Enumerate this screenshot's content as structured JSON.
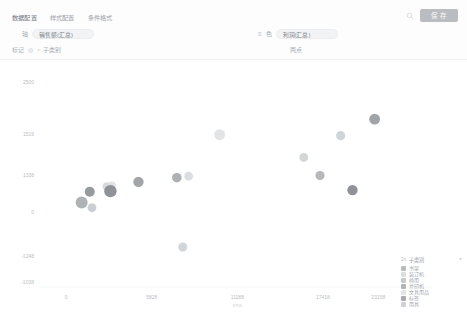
{
  "toolbar": {
    "tabs": [
      {
        "label": "数据配置",
        "active": true
      },
      {
        "label": "样式配置",
        "active": false
      },
      {
        "label": "条件格式",
        "active": false
      }
    ],
    "save_label": "保 存",
    "search_icon": "search-icon",
    "rows": [
      {
        "side": "left",
        "label": "轴",
        "icon": "hash-icon",
        "chip": "销售额(汇总)"
      },
      {
        "side": "right",
        "label": "色",
        "icon_menu": "list-icon",
        "icon_field": "text-icon",
        "chip": "利润(汇总)",
        "ghost": true
      },
      {
        "side": "left",
        "label": "标记",
        "icon1": "shape-icon",
        "icon2": "size-icon",
        "chip": "子类别"
      },
      {
        "side": "right",
        "label": "两点",
        "ghost": true
      }
    ]
  },
  "chart_data": {
    "type": "scatter",
    "title": "",
    "xlabel": "",
    "ylabel": "",
    "xlim": [
      -1500,
      23500
    ],
    "ylim": [
      -14500,
      27000
    ],
    "grid": false,
    "legend_position": "bottom-right",
    "xticks": [
      {
        "value": 0,
        "label": "0"
      },
      {
        "value": 5800,
        "label": "5828"
      },
      {
        "value": 11600,
        "label": "11188",
        "sub": "9755"
      },
      {
        "value": 17400,
        "label": "17418"
      },
      {
        "value": 21150,
        "label": "23158"
      }
    ],
    "yticks": [
      {
        "value": 25000,
        "label": "2500"
      },
      {
        "value": 15000,
        "label": "1519"
      },
      {
        "value": 7000,
        "label": "1338"
      },
      {
        "value": 0,
        "label": "0"
      },
      {
        "value": -8500,
        "label": "-1248"
      },
      {
        "value": -13500,
        "label": "-1038"
      }
    ],
    "legend": {
      "title": "子类别",
      "title_prefix": "2n",
      "collapse_icon": "collapse-icon",
      "entries": [
        {
          "label": "书架",
          "color": "#b9bcbf"
        },
        {
          "label": "装订机",
          "color": "#dcdee0"
        },
        {
          "label": "椅用",
          "color": "#c6c9cc"
        },
        {
          "label": "复印机",
          "color": "#b2b5b8"
        },
        {
          "label": "文具用品",
          "color": "#e2e4e6"
        },
        {
          "label": "标签",
          "color": "#a9acaf"
        },
        {
          "label": "用具",
          "color": "#cfd2d5"
        }
      ]
    },
    "points": [
      {
        "x": 1050,
        "y": 1800,
        "r": 6.0,
        "color": "#a9acaf",
        "label": "书架"
      },
      {
        "x": 1600,
        "y": 3900,
        "r": 5.0,
        "color": "#8f9295",
        "label": "标签"
      },
      {
        "x": 1750,
        "y": 800,
        "r": 4.4,
        "color": "#c8cbce",
        "label": "用具"
      },
      {
        "x": 2750,
        "y": 4900,
        "r": 4.2,
        "color": "#d4d7da",
        "label": "文具用品"
      },
      {
        "x": 3100,
        "y": 5100,
        "r": 4.0,
        "color": "#dde0e2",
        "label": "装订机"
      },
      {
        "x": 3000,
        "y": 4000,
        "r": 6.2,
        "color": "#858a8f",
        "label": "复印机"
      },
      {
        "x": 4900,
        "y": 5800,
        "r": 5.2,
        "color": "#9a9ea2",
        "label": "椅用"
      },
      {
        "x": 7500,
        "y": 6600,
        "r": 4.8,
        "color": "#a6aaae",
        "label": "书架"
      },
      {
        "x": 8300,
        "y": 6900,
        "r": 4.4,
        "color": "#d8dbdd",
        "label": "装订机"
      },
      {
        "x": 7900,
        "y": -6800,
        "r": 4.6,
        "color": "#cfd2d5",
        "label": "用具"
      },
      {
        "x": 10400,
        "y": 14900,
        "r": 5.4,
        "color": "#e0e2e4",
        "label": "文具用品"
      },
      {
        "x": 16100,
        "y": 10500,
        "r": 4.4,
        "color": "#cfd2d5",
        "label": "标签"
      },
      {
        "x": 17200,
        "y": 7000,
        "r": 4.6,
        "color": "#b0b3b6",
        "label": "椅用"
      },
      {
        "x": 18600,
        "y": 14700,
        "r": 4.6,
        "color": "#cdd0d3",
        "label": "用具"
      },
      {
        "x": 19400,
        "y": 4200,
        "r": 5.2,
        "color": "#85898d",
        "label": "复印机"
      },
      {
        "x": 20900,
        "y": 17900,
        "r": 5.4,
        "color": "#989c9f",
        "label": "书架"
      }
    ]
  }
}
